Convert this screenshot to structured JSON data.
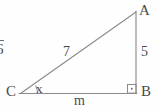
{
  "figure": {
    "background_color": "#fefefe",
    "stroke_color": "#8c8c8c",
    "text_color": "#4a4a4a"
  },
  "vertices": {
    "a_label": "A",
    "b_label": "B",
    "c_label": "C"
  },
  "sides": {
    "hypotenuse_label": "7",
    "vertical_leg_label": "5",
    "horizontal_leg_label": "m"
  },
  "angles": {
    "angle_at_c_label": "x",
    "right_angle_at_b": "·"
  },
  "fragments": {
    "radicand": "6"
  }
}
